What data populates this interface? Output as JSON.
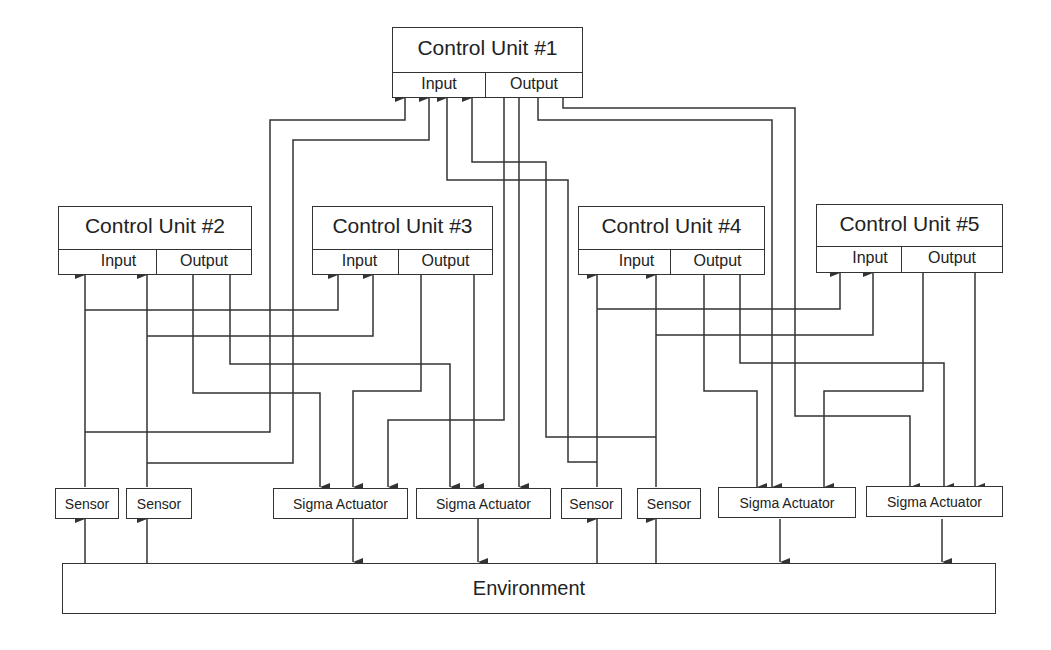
{
  "control_units": [
    {
      "id": "cu1",
      "title": "Control Unit #1",
      "input_label": "Input",
      "output_label": "Output"
    },
    {
      "id": "cu2",
      "title": "Control Unit #2",
      "input_label": "Input",
      "output_label": "Output"
    },
    {
      "id": "cu3",
      "title": "Control Unit #3",
      "input_label": "Input",
      "output_label": "Output"
    },
    {
      "id": "cu4",
      "title": "Control Unit #4",
      "input_label": "Input",
      "output_label": "Output"
    },
    {
      "id": "cu5",
      "title": "Control Unit #5",
      "input_label": "Input",
      "output_label": "Output"
    }
  ],
  "sensors": [
    {
      "label": "Sensor"
    },
    {
      "label": "Sensor"
    },
    {
      "label": "Sensor"
    },
    {
      "label": "Sensor"
    }
  ],
  "actuators": [
    {
      "label": "Sigma Actuator"
    },
    {
      "label": "Sigma Actuator"
    },
    {
      "label": "Sigma Actuator"
    },
    {
      "label": "Sigma Actuator"
    }
  ],
  "environment": {
    "label": "Environment"
  },
  "colors": {
    "line": "#333333",
    "background": "#ffffff",
    "text": "#222222"
  }
}
